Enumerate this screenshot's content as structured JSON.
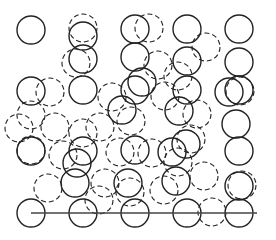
{
  "diagram": {
    "width": 276,
    "height": 240,
    "stroke_color": "#222222",
    "line_color": "#444444",
    "radius": 14,
    "baseline": {
      "x1": 31,
      "y1": 213,
      "x2": 257,
      "y2": 213
    },
    "solid_circles": [
      [
        31,
        30
      ],
      [
        135,
        29
      ],
      [
        187,
        29
      ],
      [
        239,
        29
      ],
      [
        83,
        36
      ],
      [
        83,
        59
      ],
      [
        135,
        57
      ],
      [
        187,
        61
      ],
      [
        239,
        62
      ],
      [
        31,
        91
      ],
      [
        83,
        90
      ],
      [
        135,
        90
      ],
      [
        187,
        90
      ],
      [
        239,
        90
      ],
      [
        142,
        82
      ],
      [
        229,
        92
      ],
      [
        31,
        151
      ],
      [
        83,
        151
      ],
      [
        135,
        150
      ],
      [
        186,
        144
      ],
      [
        239,
        151
      ],
      [
        75,
        183
      ],
      [
        128,
        183
      ],
      [
        176,
        181
      ],
      [
        239,
        186
      ],
      [
        31,
        213
      ],
      [
        83,
        213
      ],
      [
        135,
        213
      ],
      [
        187,
        213
      ],
      [
        239,
        213
      ],
      [
        77,
        163
      ],
      [
        122,
        110
      ],
      [
        179,
        111
      ],
      [
        172,
        152
      ],
      [
        236,
        124
      ]
    ],
    "dashed_circles": [
      [
        83,
        28
      ],
      [
        149,
        28
      ],
      [
        206,
        47
      ],
      [
        76,
        63
      ],
      [
        158,
        65
      ],
      [
        178,
        76
      ],
      [
        50,
        92
      ],
      [
        31,
        115
      ],
      [
        112,
        97
      ],
      [
        165,
        96
      ],
      [
        240,
        91
      ],
      [
        131,
        121
      ],
      [
        100,
        127
      ],
      [
        55,
        127
      ],
      [
        152,
        153
      ],
      [
        197,
        114
      ],
      [
        191,
        139
      ],
      [
        31,
        150
      ],
      [
        83,
        133
      ],
      [
        120,
        152
      ],
      [
        63,
        155
      ],
      [
        178,
        162
      ],
      [
        48,
        188
      ],
      [
        105,
        183
      ],
      [
        164,
        190
      ],
      [
        99,
        200
      ],
      [
        204,
        176
      ],
      [
        212,
        212
      ],
      [
        242,
        185
      ],
      [
        130,
        192
      ],
      [
        19,
        128
      ]
    ]
  }
}
